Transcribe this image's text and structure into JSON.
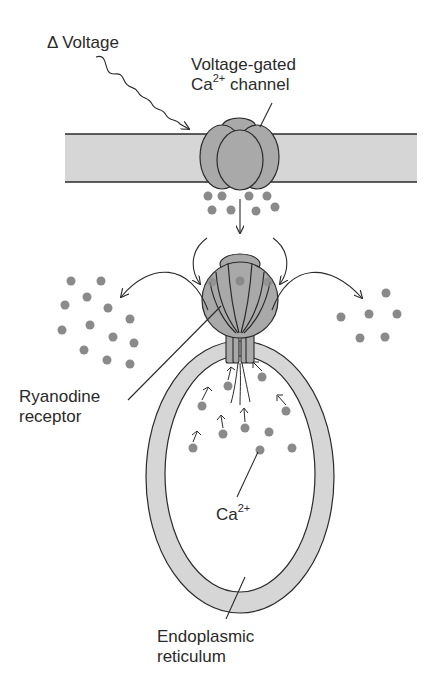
{
  "diagram": {
    "colors": {
      "membrane_fill": "#d6d6d6",
      "protein_fill": "#a9a9a9",
      "ion_fill": "#8a8a8a",
      "stroke": "#2a2a2a",
      "background": "#ffffff"
    },
    "labels": {
      "voltage": {
        "prefix": "Δ",
        "text": "Voltage"
      },
      "channel": {
        "line1": "Voltage-gated",
        "line2_base": "Ca",
        "line2_sup": "2+",
        "line2_rest": " channel"
      },
      "ryanodine": {
        "line1": "Ryanodine",
        "line2": "receptor"
      },
      "calcium": {
        "base": "Ca",
        "sup": "2+"
      },
      "er": {
        "line1": "Endoplasmic",
        "line2": "reticulum"
      }
    },
    "ion_groups": {
      "below_channel": 8,
      "left_cytosol": 15,
      "right_cytosol": 6,
      "inside_er": 11
    }
  }
}
